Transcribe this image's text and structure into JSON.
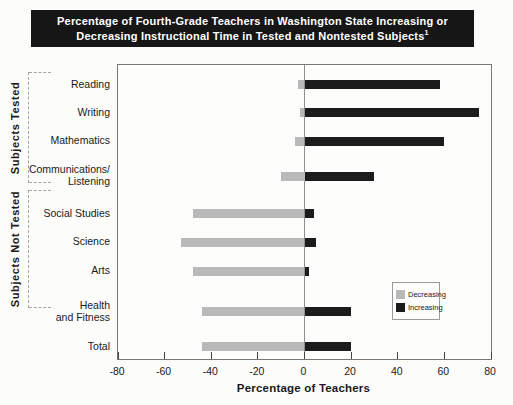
{
  "title": {
    "line1": "Percentage of Fourth-Grade Teachers in Washington State Increasing or",
    "line2": "Decreasing Instructional Time in Tested and Nontested Subjects",
    "footnote_marker": "1"
  },
  "chart_data": {
    "type": "bar",
    "orientation": "horizontal_diverging",
    "title": "Percentage of Fourth-Grade Teachers in Washington State Increasing or Decreasing Instructional Time in Tested and Nontested Subjects",
    "categories": [
      "Reading",
      "Writing",
      "Mathematics",
      "Communications/\nListening",
      "Social Studies",
      "Science",
      "Arts",
      "Health\nand Fitness",
      "Total"
    ],
    "series": [
      {
        "name": "Decreasing",
        "color": "#b9b9b9",
        "values": [
          -3,
          -2,
          -4,
          -10,
          -48,
          -53,
          -48,
          -44,
          -44
        ]
      },
      {
        "name": "Increasing",
        "color": "#1c1c1c",
        "values": [
          58,
          75,
          60,
          30,
          4,
          5,
          2,
          20,
          20
        ]
      }
    ],
    "xlabel": "Percentage of Teachers",
    "x_ticks": [
      -80,
      -60,
      -40,
      -20,
      0,
      20,
      40,
      60,
      80
    ],
    "xlim": [
      -80,
      80
    ],
    "grid": false,
    "legend_position": "lower_right",
    "groups": [
      {
        "label": "Subjects Tested",
        "row_start": 0,
        "row_end": 3
      },
      {
        "label": "Subjects Not Tested",
        "row_start": 4,
        "row_end": 7
      }
    ],
    "row_center_fracs": [
      0.068,
      0.163,
      0.26,
      0.379,
      0.506,
      0.603,
      0.701,
      0.84,
      0.958
    ]
  },
  "legend": {
    "items": [
      {
        "label": "Decreasing",
        "swatch_color": "#b9b9b9"
      },
      {
        "label": "Increasing",
        "swatch_color": "#1c1c1c"
      }
    ]
  },
  "colors": {
    "title_bg": "#161616",
    "title_text": "#ffffff",
    "decreasing_bar": "#b9b9b9",
    "increasing_bar": "#1c1c1c",
    "zero_line": "#909090",
    "plot_border": "#777777"
  }
}
